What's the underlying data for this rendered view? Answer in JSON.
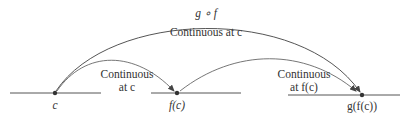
{
  "diagram": {
    "colors": {
      "line": "#555555",
      "point": "#333333",
      "text": "#333333",
      "background": "#ffffff"
    },
    "composite_label": "g ∘ f",
    "composite_caption": "Continuous at c",
    "arc_f": {
      "line1": "Continuous",
      "line2": "at c"
    },
    "arc_g": {
      "line1": "Continuous",
      "line2": "at f(c)"
    },
    "points": {
      "c": "c",
      "fc": "f(c)",
      "gfc": "g(f(c))"
    }
  }
}
